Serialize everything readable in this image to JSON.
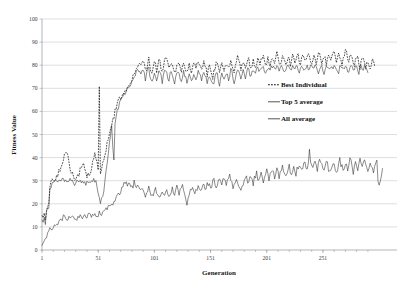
{
  "chart_data": {
    "type": "line",
    "title": "",
    "xlabel": "Generation",
    "ylabel": "Fitness Value",
    "xlim": [
      1,
      300
    ],
    "ylim": [
      0,
      100
    ],
    "grid": true,
    "legend_position": "center-right",
    "xticks": [
      "1",
      "51",
      "101",
      "151",
      "201",
      "251"
    ],
    "xtick_values": [
      1,
      51,
      101,
      151,
      201,
      251
    ],
    "yticks": [
      "0",
      "10",
      "20",
      "30",
      "40",
      "50",
      "60",
      "70",
      "80",
      "90",
      "100"
    ],
    "ytick_values": [
      0,
      10,
      20,
      30,
      40,
      50,
      60,
      70,
      80,
      90,
      100
    ],
    "legend": [
      {
        "label": "Best Individual",
        "style": "dashed",
        "color": "#141414"
      },
      {
        "label": "Top 5 average",
        "style": "solid",
        "color": "#2b2b2b"
      },
      {
        "label": "All average",
        "style": "solid",
        "color": "#2b2b2b"
      }
    ],
    "series": [
      {
        "name": "Best Individual",
        "style": "dashed",
        "color": "#141414",
        "values": [
          15,
          14,
          16,
          13,
          18,
          20,
          19,
          28,
          29,
          30,
          30,
          31,
          31,
          32,
          33,
          34,
          35,
          36,
          38,
          40,
          42,
          43,
          42,
          40,
          38,
          36,
          34,
          33,
          32,
          31,
          31,
          31,
          32,
          33,
          35,
          36,
          38,
          37,
          35,
          33,
          32,
          32,
          33,
          34,
          36,
          38,
          40,
          41,
          39,
          37,
          35,
          72,
          34,
          36,
          38,
          40,
          42,
          44,
          46,
          48,
          50,
          52,
          54,
          56,
          58,
          60,
          62,
          63,
          64,
          65,
          66,
          67,
          68,
          69,
          70,
          70,
          71,
          72,
          72,
          73,
          74,
          75,
          76,
          78,
          79,
          80,
          81,
          80,
          79,
          81,
          82,
          80,
          78,
          79,
          81,
          83,
          80,
          78,
          77,
          79,
          81,
          80,
          78,
          80,
          82,
          81,
          79,
          77,
          79,
          81,
          83,
          82,
          80,
          78,
          80,
          82,
          80,
          78,
          76,
          78,
          80,
          82,
          81,
          79,
          77,
          79,
          81,
          80,
          78,
          76,
          78,
          80,
          79,
          77,
          79,
          81,
          80,
          78,
          80,
          82,
          81,
          79,
          77,
          79,
          81,
          80,
          78,
          76,
          78,
          80,
          79,
          77,
          75,
          77,
          79,
          81,
          80,
          78,
          76,
          78,
          80,
          79,
          77,
          79,
          81,
          80,
          78,
          80,
          82,
          81,
          79,
          77,
          79,
          81,
          83,
          82,
          80,
          78,
          80,
          82,
          81,
          79,
          81,
          83,
          82,
          80,
          78,
          80,
          82,
          81,
          79,
          81,
          83,
          82,
          80,
          82,
          84,
          83,
          81,
          79,
          81,
          83,
          82,
          80,
          82,
          84,
          83,
          81,
          83,
          85,
          84,
          82,
          80,
          82,
          84,
          83,
          81,
          79,
          81,
          83,
          82,
          80,
          82,
          84,
          83,
          81,
          83,
          85,
          84,
          82,
          80,
          82,
          84,
          83,
          81,
          83,
          85,
          86,
          84,
          82,
          80,
          82,
          84,
          83,
          81,
          83,
          85,
          84,
          82,
          80,
          82,
          84,
          83,
          81,
          83,
          85,
          84,
          82,
          84,
          86,
          85,
          83,
          81,
          83,
          85,
          84,
          82,
          80,
          82,
          84,
          86,
          85,
          83,
          81,
          83,
          85,
          84,
          82,
          80,
          82,
          84,
          83,
          81,
          79,
          81,
          83,
          82,
          80,
          78,
          80,
          82,
          81,
          79,
          81,
          83,
          82,
          80
        ]
      },
      {
        "name": "Top 5 average",
        "style": "solid",
        "color": "#2b2b2b",
        "values": [
          13,
          12,
          14,
          11,
          16,
          18,
          17,
          26,
          27,
          28,
          29,
          29,
          30,
          30,
          30,
          30,
          30,
          30,
          30,
          30,
          30,
          30,
          30,
          30,
          30,
          30,
          30,
          30,
          30,
          29,
          29,
          30,
          30,
          30,
          30,
          30,
          30,
          30,
          30,
          29,
          29,
          30,
          30,
          30,
          30,
          30,
          30,
          30,
          29,
          28,
          25,
          22,
          20,
          22,
          24,
          26,
          30,
          34,
          38,
          42,
          46,
          50,
          54,
          45,
          40,
          55,
          58,
          60,
          62,
          63,
          64,
          65,
          66,
          67,
          68,
          69,
          70,
          71,
          71,
          72,
          73,
          74,
          75,
          76,
          77,
          78,
          78,
          77,
          76,
          77,
          78,
          76,
          74,
          76,
          78,
          79,
          76,
          74,
          73,
          75,
          77,
          76,
          74,
          76,
          78,
          77,
          75,
          73,
          75,
          77,
          78,
          77,
          75,
          74,
          76,
          78,
          76,
          74,
          72,
          74,
          76,
          78,
          77,
          75,
          73,
          75,
          77,
          76,
          74,
          72,
          74,
          76,
          75,
          73,
          75,
          77,
          76,
          74,
          76,
          78,
          77,
          75,
          73,
          75,
          77,
          76,
          74,
          72,
          74,
          76,
          75,
          73,
          71,
          73,
          75,
          77,
          76,
          74,
          72,
          74,
          76,
          75,
          73,
          75,
          77,
          76,
          74,
          76,
          78,
          77,
          75,
          73,
          75,
          77,
          78,
          77,
          75,
          74,
          76,
          78,
          77,
          75,
          77,
          78,
          78,
          76,
          75,
          77,
          78,
          77,
          76,
          78,
          79,
          78,
          77,
          78,
          79,
          79,
          78,
          77,
          78,
          79,
          79,
          78,
          79,
          79,
          79,
          78,
          79,
          79,
          79,
          78,
          79,
          79,
          79,
          78,
          77,
          79,
          79,
          79,
          78,
          79,
          79,
          79,
          78,
          79,
          79,
          79,
          78,
          77,
          79,
          79,
          79,
          78,
          79,
          79,
          79,
          78,
          79,
          79,
          79,
          78,
          79,
          79,
          79,
          78,
          77,
          79,
          79,
          79,
          78,
          77,
          79,
          79,
          79,
          78,
          79,
          79,
          79,
          78,
          79,
          79,
          79,
          78,
          77,
          79,
          79,
          79,
          78,
          79,
          79,
          79,
          78,
          77,
          79,
          79,
          79,
          78,
          79,
          79,
          79,
          78,
          77,
          79,
          79,
          79,
          78,
          79,
          79,
          78,
          77
        ]
      },
      {
        "name": "All average",
        "style": "solid",
        "color": "#2b2b2b",
        "values": [
          2,
          3,
          4,
          5,
          6,
          7,
          8,
          9,
          9,
          10,
          10,
          11,
          11,
          12,
          12,
          12,
          13,
          13,
          13,
          14,
          14,
          13,
          13,
          14,
          14,
          14,
          14,
          14,
          14,
          14,
          14,
          14,
          14,
          14,
          14,
          14,
          14,
          14,
          15,
          14,
          14,
          15,
          15,
          15,
          15,
          15,
          15,
          16,
          15,
          15,
          15,
          16,
          16,
          16,
          16,
          17,
          17,
          17,
          18,
          18,
          18,
          19,
          19,
          20,
          20,
          21,
          22,
          23,
          24,
          25,
          26,
          27,
          28,
          29,
          30,
          29,
          28,
          29,
          30,
          28,
          27,
          28,
          29,
          27,
          26,
          27,
          28,
          26,
          25,
          26,
          27,
          25,
          24,
          25,
          26,
          27,
          25,
          24,
          23,
          24,
          25,
          26,
          24,
          23,
          22,
          24,
          25,
          26,
          24,
          23,
          25,
          26,
          24,
          23,
          25,
          26,
          27,
          25,
          24,
          26,
          27,
          25,
          24,
          26,
          27,
          28,
          26,
          25,
          23,
          19,
          22,
          24,
          25,
          26,
          27,
          25,
          24,
          26,
          27,
          28,
          26,
          25,
          27,
          28,
          29,
          27,
          26,
          28,
          29,
          30,
          28,
          27,
          29,
          30,
          28,
          27,
          29,
          30,
          31,
          29,
          28,
          30,
          31,
          29,
          28,
          30,
          31,
          32,
          30,
          29,
          27,
          28,
          30,
          31,
          29,
          28,
          26,
          25,
          27,
          29,
          30,
          31,
          32,
          30,
          29,
          31,
          32,
          30,
          29,
          31,
          32,
          33,
          31,
          30,
          32,
          33,
          31,
          30,
          32,
          33,
          34,
          32,
          31,
          33,
          34,
          35,
          33,
          32,
          34,
          35,
          33,
          32,
          34,
          35,
          36,
          34,
          33,
          31,
          33,
          35,
          36,
          34,
          33,
          35,
          36,
          34,
          33,
          35,
          36,
          37,
          35,
          34,
          36,
          37,
          38,
          36,
          35,
          37,
          43,
          38,
          36,
          35,
          37,
          38,
          36,
          35,
          37,
          38,
          39,
          37,
          36,
          34,
          36,
          38,
          37,
          35,
          33,
          35,
          37,
          38,
          36,
          35,
          33,
          35,
          37,
          39,
          37,
          36,
          34,
          36,
          38,
          37,
          35,
          37,
          39,
          38,
          36,
          34,
          36,
          38,
          37,
          35,
          37,
          39,
          38,
          36,
          38,
          40,
          38,
          36,
          34,
          36,
          38,
          37,
          35,
          33,
          35,
          37,
          39,
          31,
          28,
          30,
          32,
          34
        ]
      }
    ]
  }
}
